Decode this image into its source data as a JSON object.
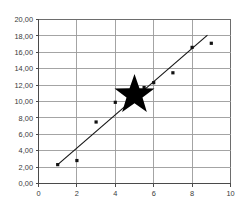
{
  "chart_data": {
    "type": "scatter",
    "title": "",
    "subtitle": "",
    "xlabel": "",
    "ylabel": "",
    "xlim": [
      0,
      10
    ],
    "ylim": [
      0,
      20
    ],
    "grid": true,
    "legend": "none",
    "x_tick_labels": [
      "0",
      "2",
      "4",
      "6",
      "8",
      "10"
    ],
    "x_ticks": [
      0,
      2,
      4,
      6,
      8,
      10
    ],
    "y_tick_labels": [
      "0,00",
      "2,00",
      "4,00",
      "6,00",
      "8,00",
      "10,00",
      "12,00",
      "14,00",
      "16,00",
      "18,00",
      "20,00"
    ],
    "y_ticks": [
      0,
      2,
      4,
      6,
      8,
      10,
      12,
      14,
      16,
      18,
      20
    ],
    "decimal_separator": ",",
    "series": [
      {
        "name": "data-points",
        "marker": "dot",
        "color": "#111111",
        "points": [
          {
            "x": 1,
            "y": 2.3
          },
          {
            "x": 2,
            "y": 2.8
          },
          {
            "x": 3,
            "y": 7.5
          },
          {
            "x": 4,
            "y": 9.9
          },
          {
            "x": 5.5,
            "y": 11.7
          },
          {
            "x": 6,
            "y": 12.3
          },
          {
            "x": 7,
            "y": 13.5
          },
          {
            "x": 8,
            "y": 16.6
          },
          {
            "x": 9,
            "y": 17.1
          }
        ]
      },
      {
        "name": "trendline",
        "marker": "line",
        "color": "#151515",
        "points": [
          {
            "x": 1,
            "y": 2.3
          },
          {
            "x": 8.8,
            "y": 18.1
          }
        ]
      },
      {
        "name": "star-highlight",
        "marker": "star",
        "color": "#000000",
        "points": [
          {
            "x": 5.0,
            "y": 10.8
          }
        ],
        "marker_radius_px": 21
      }
    ]
  },
  "annotations": {
    "star_label": "highlighted point"
  }
}
